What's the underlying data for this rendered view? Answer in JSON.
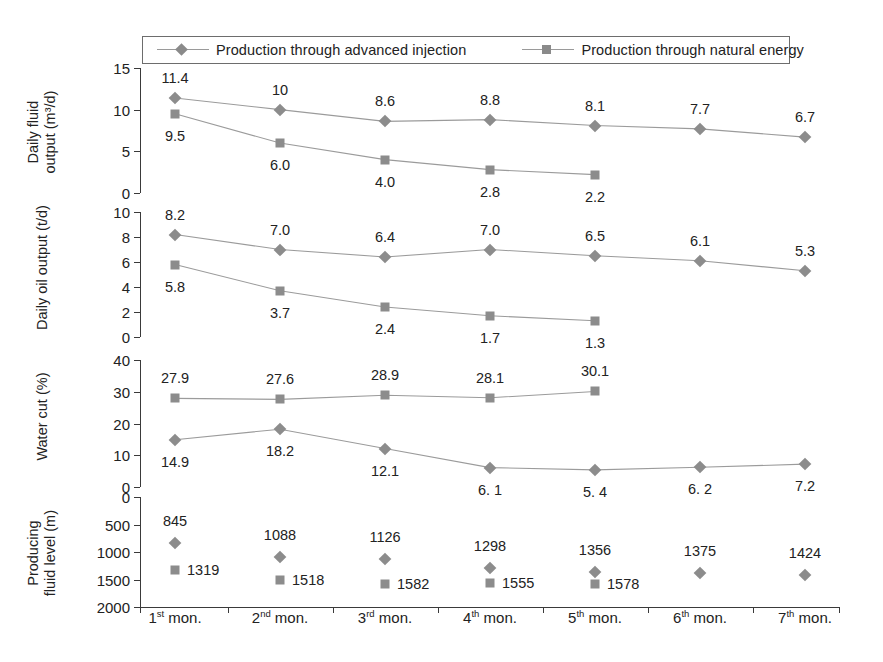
{
  "legend": {
    "entries": [
      {
        "label": "Production through advanced injection",
        "marker": "diamond-marker-icon",
        "color": "#8a8a8a"
      },
      {
        "label": "Production through natural energy",
        "marker": "square-marker-icon",
        "color": "#8a8a8a"
      }
    ]
  },
  "x_categories": [
    {
      "ordinal": "1",
      "suffix": "st",
      "text": " mon."
    },
    {
      "ordinal": "2",
      "suffix": "nd",
      "text": " mon."
    },
    {
      "ordinal": "3",
      "suffix": "rd",
      "text": " mon."
    },
    {
      "ordinal": "4",
      "suffix": "th",
      "text": " mon."
    },
    {
      "ordinal": "5",
      "suffix": "th",
      "text": " mon."
    },
    {
      "ordinal": "6",
      "suffix": "th",
      "text": " mon."
    },
    {
      "ordinal": "7",
      "suffix": "th",
      "text": " mon."
    }
  ],
  "panels": {
    "p1": {
      "ylabel": "Daily fluid output (m³/d)",
      "ylabel_line1": "Daily fluid",
      "ylabel_line2": "output (m³/d)",
      "ticks": [
        "0",
        "5",
        "10",
        "15"
      ]
    },
    "p2": {
      "ylabel": "Daily oil output (t/d)",
      "ylabel_line1": "Daily oil output (t/d)",
      "ylabel_line2": "",
      "ticks": [
        "0",
        "2",
        "4",
        "6",
        "8",
        "10"
      ]
    },
    "p3": {
      "ylabel": "Water cut (%)",
      "ylabel_line1": "Water cut (%)",
      "ylabel_line2": "",
      "ticks": [
        "0",
        "10",
        "20",
        "30",
        "40"
      ]
    },
    "p4": {
      "ylabel": "Producing fluid level (m)",
      "ylabel_line1": "Producing",
      "ylabel_line2": "fluid level (m)",
      "ticks": [
        "0",
        "500",
        "1000",
        "1500",
        "2000"
      ]
    }
  },
  "chart_data": [
    {
      "type": "line",
      "title": "Daily fluid output",
      "xlabel": "",
      "ylabel": "Daily fluid output (m³/d)",
      "ylim": [
        0,
        15
      ],
      "yticks": [
        0,
        5,
        10,
        15
      ],
      "grid": false,
      "legend_position": "top",
      "categories": [
        "1st mon.",
        "2nd mon.",
        "3rd mon.",
        "4th mon.",
        "5th mon.",
        "6th mon.",
        "7th mon."
      ],
      "series": [
        {
          "name": "Production through advanced injection",
          "marker": "diamond",
          "values": [
            11.4,
            10,
            8.6,
            8.8,
            8.1,
            7.7,
            6.7
          ],
          "labels": [
            "11.4",
            "10",
            "8.6",
            "8.8",
            "8.1",
            "7.7",
            "6.7"
          ]
        },
        {
          "name": "Production through natural energy",
          "marker": "square",
          "values": [
            9.5,
            6.0,
            4.0,
            2.8,
            2.2,
            null,
            null
          ],
          "labels": [
            "9.5",
            "6.0",
            "4.0",
            "2.8",
            "2.2",
            "",
            ""
          ]
        }
      ]
    },
    {
      "type": "line",
      "title": "Daily oil output",
      "xlabel": "",
      "ylabel": "Daily oil output (t/d)",
      "ylim": [
        0,
        10
      ],
      "yticks": [
        0,
        2,
        4,
        6,
        8,
        10
      ],
      "grid": false,
      "legend_position": "top",
      "categories": [
        "1st mon.",
        "2nd mon.",
        "3rd mon.",
        "4th mon.",
        "5th mon.",
        "6th mon.",
        "7th mon."
      ],
      "series": [
        {
          "name": "Production through advanced injection",
          "marker": "diamond",
          "values": [
            8.2,
            7.0,
            6.4,
            7.0,
            6.5,
            6.1,
            5.3
          ],
          "labels": [
            "8.2",
            "7.0",
            "6.4",
            "7.0",
            "6.5",
            "6.1",
            "5.3"
          ]
        },
        {
          "name": "Production through natural energy",
          "marker": "square",
          "values": [
            5.8,
            3.7,
            2.4,
            1.7,
            1.3,
            null,
            null
          ],
          "labels": [
            "5.8",
            "3.7",
            "2.4",
            "1.7",
            "1.3",
            "",
            ""
          ]
        }
      ]
    },
    {
      "type": "line",
      "title": "Water cut",
      "xlabel": "",
      "ylabel": "Water cut (%)",
      "ylim": [
        0,
        40
      ],
      "yticks": [
        0,
        10,
        20,
        30,
        40
      ],
      "grid": false,
      "legend_position": "top",
      "categories": [
        "1st mon.",
        "2nd mon.",
        "3rd mon.",
        "4th mon.",
        "5th mon.",
        "6th mon.",
        "7th mon."
      ],
      "series": [
        {
          "name": "Production through advanced injection",
          "marker": "diamond",
          "values": [
            14.9,
            18.2,
            12.1,
            6.1,
            5.4,
            6.2,
            7.2
          ],
          "labels": [
            "14.9",
            "18.2",
            "12.1",
            "6. 1",
            "5. 4",
            "6. 2",
            "7.2"
          ]
        },
        {
          "name": "Production through natural energy",
          "marker": "square",
          "values": [
            27.9,
            27.6,
            28.9,
            28.1,
            30.1,
            null,
            null
          ],
          "labels": [
            "27.9",
            "27.6",
            "28.9",
            "28.1",
            "30.1",
            "",
            ""
          ]
        }
      ]
    },
    {
      "type": "scatter",
      "title": "Producing fluid level",
      "xlabel": "",
      "ylabel": "Producing fluid level (m)",
      "ylim": [
        2000,
        0
      ],
      "yticks": [
        0,
        500,
        1000,
        1500,
        2000
      ],
      "y_inverted": true,
      "grid": false,
      "legend_position": "top",
      "categories": [
        "1st mon.",
        "2nd mon.",
        "3rd mon.",
        "4th mon.",
        "5th mon.",
        "6th mon.",
        "7th mon."
      ],
      "series": [
        {
          "name": "Production through advanced injection",
          "marker": "diamond",
          "values": [
            845,
            1088,
            1126,
            1298,
            1356,
            1375,
            1424
          ],
          "labels": [
            "845",
            "1088",
            "1126",
            "1298",
            "1356",
            "1375",
            "1424"
          ]
        },
        {
          "name": "Production through natural energy",
          "marker": "square",
          "values": [
            1319,
            1518,
            1582,
            1555,
            1578,
            null,
            null
          ],
          "labels": [
            "1319",
            "1518",
            "1582",
            "1555",
            "1578",
            "",
            ""
          ]
        }
      ]
    }
  ]
}
